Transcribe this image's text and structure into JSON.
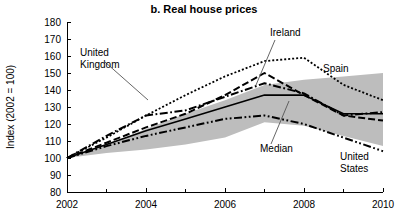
{
  "chart_data": {
    "type": "line",
    "title": "b. Real house prices",
    "xlabel": "",
    "ylabel": "Index (2002 = 100)",
    "xlim": [
      2002,
      2010
    ],
    "ylim": [
      80,
      180
    ],
    "grid": false,
    "legend_position": "inline-annotations",
    "x": [
      2002,
      2003,
      2004,
      2005,
      2006,
      2007,
      2008,
      2009,
      2010
    ],
    "xticks": [
      2002,
      2004,
      2006,
      2008,
      2010
    ],
    "xticklabels": [
      "2002",
      "2004",
      "2006",
      "2008",
      "2010"
    ],
    "xminorticks": [
      2003,
      2005,
      2007,
      2009
    ],
    "yticks": [
      80,
      90,
      100,
      110,
      120,
      130,
      140,
      150,
      160,
      170,
      180
    ],
    "yticklabels": [
      "80",
      "90",
      "100",
      "110",
      "120",
      "130",
      "140",
      "150",
      "160",
      "170",
      "180"
    ],
    "series": [
      {
        "name": "Spain",
        "style": "dotted",
        "values": [
          100,
          112,
          125,
          137,
          148,
          157,
          159,
          143,
          134
        ]
      },
      {
        "name": "Ireland",
        "style": "dashed",
        "values": [
          100,
          109,
          118,
          126,
          137,
          150,
          137,
          125,
          122
        ]
      },
      {
        "name": "United Kingdom",
        "style": "dashdot",
        "values": [
          100,
          113,
          125,
          128,
          136,
          144,
          138,
          125,
          127
        ]
      },
      {
        "name": "Median",
        "style": "solid",
        "values": [
          100,
          108,
          116,
          123,
          130,
          137,
          137,
          126,
          126
        ]
      },
      {
        "name": "United States",
        "style": "dashdotdot",
        "values": [
          100,
          107,
          113,
          118,
          123,
          125,
          120,
          112,
          104
        ]
      }
    ],
    "band": {
      "name": "interquartile-range-band",
      "color": "#bdbdbd",
      "upper": [
        100,
        108,
        117,
        126,
        134,
        143,
        146,
        148,
        150
      ],
      "lower": [
        100,
        103,
        105,
        108,
        112,
        121,
        119,
        113,
        107
      ]
    },
    "annotations": [
      {
        "name": "united-kingdom",
        "label_line1": "United",
        "label_line2": "Kingdom",
        "label_x": 80,
        "label_y": 56,
        "leader_from_x": 105,
        "leader_from_y": 62,
        "leader_to_x": 148,
        "leader_to_y": 100
      },
      {
        "name": "ireland",
        "label_line1": "Ireland",
        "label_line2": "",
        "label_x": 270,
        "label_y": 36,
        "leader_from_x": 275,
        "leader_from_y": 40,
        "leader_to_x": 256,
        "leader_to_y": 85
      },
      {
        "name": "spain",
        "label_line1": "Spain",
        "label_line2": "",
        "label_x": 323,
        "label_y": 72,
        "leader_from_x": 0,
        "leader_from_y": 0,
        "leader_to_x": 0,
        "leader_to_y": 0
      },
      {
        "name": "median",
        "label_line1": "Median",
        "label_line2": "",
        "label_x": 260,
        "label_y": 152,
        "leader_from_x": 271,
        "leader_from_y": 144,
        "leader_to_x": 289,
        "leader_to_y": 101
      },
      {
        "name": "united-states",
        "label_line1": "United",
        "label_line2": "States",
        "label_x": 340,
        "label_y": 160,
        "leader_from_x": 0,
        "leader_from_y": 0,
        "leader_to_x": 0,
        "leader_to_y": 0
      }
    ]
  }
}
